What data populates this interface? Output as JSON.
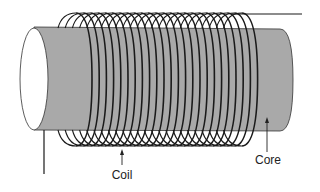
{
  "figure": {
    "type": "solenoid-diagram",
    "colors": {
      "core_fill": "#a9a9a9",
      "core_end_face": "#ffffff",
      "wire": "#1a1a1a",
      "outline": "#333333"
    },
    "coil": {
      "turns": 24,
      "x_start": 62,
      "pitch": 7.2
    },
    "labels": {
      "coil": "Coil",
      "core": "Core"
    }
  }
}
